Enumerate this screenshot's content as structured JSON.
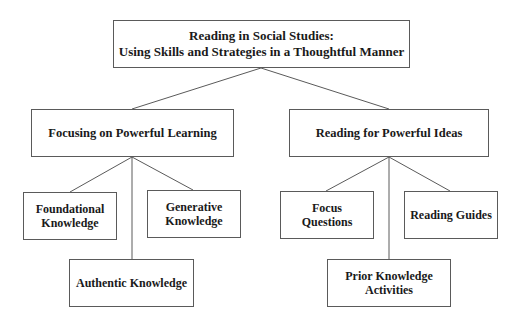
{
  "diagram": {
    "type": "tree",
    "colors": {
      "line": "#5a5a5a",
      "text": "#1a1a1a",
      "background": "#ffffff"
    },
    "root": {
      "line1": "Reading in Social Studies:",
      "line2": "Using Skills and Strategies in a Thoughtful Manner"
    },
    "branches": [
      {
        "label": "Focusing on Powerful Learning",
        "children": [
          {
            "line1": "Foundational",
            "line2": "Knowledge"
          },
          {
            "line1": "Authentic Knowledge",
            "line2": ""
          },
          {
            "line1": "Generative",
            "line2": "Knowledge"
          }
        ]
      },
      {
        "label": "Reading for Powerful Ideas",
        "children": [
          {
            "line1": "Focus",
            "line2": "Questions"
          },
          {
            "line1": "Prior Knowledge",
            "line2": "Activities"
          },
          {
            "line1": "Reading Guides",
            "line2": ""
          }
        ]
      }
    ]
  }
}
